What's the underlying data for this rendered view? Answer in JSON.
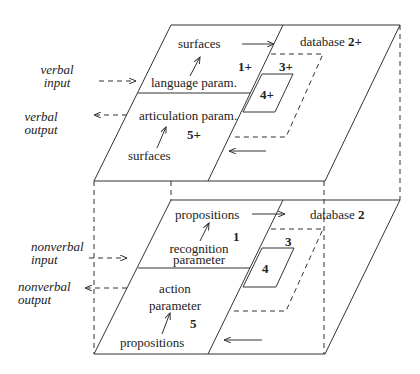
{
  "diagram": {
    "type": "two-layer interface diagram",
    "upper_layer": {
      "name": "verbal",
      "side_labels": {
        "input": [
          "verbal",
          "input"
        ],
        "output": [
          "verbal",
          "output"
        ]
      },
      "agent_half": {
        "top_label": "surfaces",
        "recognition": "language param.",
        "action": "articulation param.",
        "bottom_label": "surfaces",
        "region_1": "1+",
        "region_5": "5+"
      },
      "database_half": {
        "label": "database",
        "number": "2+",
        "region_3": "3+",
        "region_4": "4+"
      }
    },
    "lower_layer": {
      "name": "nonverbal",
      "side_labels": {
        "input": [
          "nonverbal",
          "input"
        ],
        "output": [
          "nonverbal",
          "output"
        ]
      },
      "agent_half": {
        "top_label": "propositions",
        "recognition": [
          "recognition",
          "parameter"
        ],
        "action": [
          "action",
          "parameter"
        ],
        "bottom_label": "propositions",
        "region_1": "1",
        "region_5": "5"
      },
      "database_half": {
        "label": "database",
        "number": "2",
        "region_3": "3",
        "region_4": "4"
      }
    },
    "colors": {
      "line": "#333333",
      "text": "#222222",
      "background": "#ffffff"
    }
  }
}
